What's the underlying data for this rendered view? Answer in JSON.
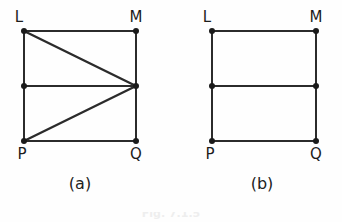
{
  "figure": {
    "background_color": "#fefefe",
    "line_color": "#2b2b2b",
    "vertex_color": "#1a1a1a",
    "label_color": "#1c1c1c",
    "bottom_caption": "Fig. 7.1.5",
    "panels": [
      {
        "id": "panel-a",
        "caption": "(a)",
        "caption_x": 80,
        "caption_y": 189,
        "vertices": [
          {
            "name": "L",
            "x": 24,
            "y": 31,
            "label": "L",
            "label_x": 19,
            "label_y": 22,
            "label_anchor": "middle"
          },
          {
            "name": "M",
            "x": 136,
            "y": 31,
            "label": "M",
            "label_x": 136,
            "label_y": 22,
            "label_anchor": "middle"
          },
          {
            "name": "R",
            "x": 24,
            "y": 86,
            "label": "",
            "label_x": 0,
            "label_y": 0,
            "label_anchor": "middle"
          },
          {
            "name": "S",
            "x": 136,
            "y": 86,
            "label": "",
            "label_x": 0,
            "label_y": 0,
            "label_anchor": "middle"
          },
          {
            "name": "P",
            "x": 24,
            "y": 141,
            "label": "P",
            "label_x": 22,
            "label_y": 159,
            "label_anchor": "middle"
          },
          {
            "name": "Q",
            "x": 136,
            "y": 141,
            "label": "Q",
            "label_x": 136,
            "label_y": 159,
            "label_anchor": "middle"
          }
        ],
        "edges": [
          {
            "from": "L",
            "to": "M",
            "kind": "side"
          },
          {
            "from": "M",
            "to": "Q",
            "kind": "side"
          },
          {
            "from": "Q",
            "to": "P",
            "kind": "side"
          },
          {
            "from": "P",
            "to": "L",
            "kind": "side"
          },
          {
            "from": "R",
            "to": "S",
            "kind": "side"
          },
          {
            "from": "L",
            "to": "S",
            "kind": "diagonal"
          },
          {
            "from": "P",
            "to": "S",
            "kind": "diagonal"
          }
        ]
      },
      {
        "id": "panel-b",
        "caption": "(b)",
        "caption_x": 262,
        "caption_y": 189,
        "vertices": [
          {
            "name": "L",
            "x": 212,
            "y": 31,
            "label": "L",
            "label_x": 207,
            "label_y": 22,
            "label_anchor": "middle"
          },
          {
            "name": "M",
            "x": 316,
            "y": 31,
            "label": "M",
            "label_x": 316,
            "label_y": 22,
            "label_anchor": "middle"
          },
          {
            "name": "R",
            "x": 212,
            "y": 86,
            "label": "",
            "label_x": 0,
            "label_y": 0,
            "label_anchor": "middle"
          },
          {
            "name": "S",
            "x": 316,
            "y": 86,
            "label": "",
            "label_x": 0,
            "label_y": 0,
            "label_anchor": "middle"
          },
          {
            "name": "P",
            "x": 212,
            "y": 141,
            "label": "P",
            "label_x": 210,
            "label_y": 159,
            "label_anchor": "middle"
          },
          {
            "name": "Q",
            "x": 316,
            "y": 141,
            "label": "Q",
            "label_x": 316,
            "label_y": 159,
            "label_anchor": "middle"
          }
        ],
        "edges": [
          {
            "from": "L",
            "to": "M",
            "kind": "side"
          },
          {
            "from": "M",
            "to": "Q",
            "kind": "side"
          },
          {
            "from": "Q",
            "to": "P",
            "kind": "side"
          },
          {
            "from": "P",
            "to": "L",
            "kind": "side"
          },
          {
            "from": "R",
            "to": "S",
            "kind": "side"
          }
        ]
      }
    ]
  }
}
